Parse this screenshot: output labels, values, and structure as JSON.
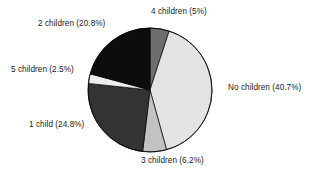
{
  "chart_data": {
    "type": "pie",
    "title": "",
    "subtitle": "",
    "xlabel": "",
    "ylabel": "",
    "legend_position": "none",
    "grid": false,
    "start_angle_deg": 0,
    "direction": "clockwise",
    "categories": [
      "4 children",
      "No children",
      "3 children",
      "1 child",
      "5 children",
      "2 children"
    ],
    "values": [
      5.0,
      40.7,
      6.2,
      24.8,
      2.5,
      20.8
    ],
    "units": "percent",
    "slices": [
      {
        "name": "4 children",
        "value": 5.0,
        "label": "4 children (5%)",
        "color": "#6e6e6e"
      },
      {
        "name": "No children",
        "value": 40.7,
        "label": "No children (40.7%)",
        "color": "#e3e3e3"
      },
      {
        "name": "3 children",
        "value": 6.2,
        "label": "3 children (6.2%)",
        "color": "#c2c2c2"
      },
      {
        "name": "1 child",
        "value": 24.8,
        "label": "1 child (24.8%)",
        "color": "#333333"
      },
      {
        "name": "5 children",
        "value": 2.5,
        "label": "5 children (2.5%)",
        "color": "#ededed"
      },
      {
        "name": "2 children",
        "value": 20.8,
        "label": "2 children (20.8%)",
        "color": "#0d0d0d"
      }
    ],
    "colors": {
      "background": "#ffffff",
      "outline": "#000000",
      "text": "#1a1a1a"
    },
    "geometry": {
      "center_x": 150,
      "center_y": 90,
      "radius": 62
    }
  }
}
